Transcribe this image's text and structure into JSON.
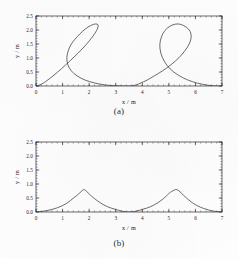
{
  "figure": {
    "background_color": "#fdfdfd",
    "ink_color": "#2b2b2b",
    "curve_color": "#3a3a3a"
  },
  "panels": [
    {
      "id": "a",
      "caption": "(a)",
      "xlabel": "x / m",
      "ylabel": "y / m",
      "xticklabels": [
        "0",
        "1",
        "2",
        "3",
        "4",
        "5",
        "6",
        "7"
      ],
      "yticklabels": [
        "0.0",
        "0.5",
        "1.0",
        "1.5",
        "2.0",
        "2.5"
      ]
    },
    {
      "id": "b",
      "caption": "(b)",
      "xlabel": "x / m",
      "ylabel": "y / m",
      "xticklabels": [
        "0",
        "1",
        "2",
        "3",
        "4",
        "5",
        "6",
        "7"
      ],
      "yticklabels": [
        "0.0",
        "0.5",
        "1.0",
        "1.5",
        "2.0",
        "2.5"
      ]
    }
  ],
  "chart_data": [
    {
      "type": "line",
      "panel": "a",
      "title": "(a)",
      "xlabel": "x / m",
      "ylabel": "y / m",
      "xlim": [
        0,
        7
      ],
      "ylim": [
        0.0,
        2.5
      ],
      "xticks": [
        0,
        1,
        2,
        3,
        4,
        5,
        6,
        7
      ],
      "yticks": [
        0.0,
        0.5,
        1.0,
        1.5,
        2.0,
        2.5
      ],
      "grid": false,
      "legend": null,
      "description": "Prolate cycloid (trochoid with loops): two looped arches over x = 0 to 7",
      "curve_family": "prolate cycloid",
      "parametric": {
        "x": "a*t - b*sin(t)",
        "y": "a - b*cos(t)",
        "a": 0.5577,
        "b": 1.111,
        "t_range": [
          0,
          12.566
        ]
      },
      "features": {
        "loop_centers_x": [
          1.75,
          5.25
        ],
        "loop_top_y": 2.2,
        "self_crossing_y": 0.65,
        "self_crossing_x": [
          1.75,
          5.25
        ],
        "baseline_minima_x": [
          0.0,
          3.5,
          7.0
        ],
        "baseline_y": 0.0
      },
      "series": [
        {
          "name": "prolate cycloid",
          "x": [
            0.0,
            0.12,
            0.27,
            0.45,
            0.68,
            0.95,
            1.26,
            1.58,
            1.88,
            2.12,
            2.28,
            2.34,
            2.3,
            2.16,
            1.95,
            1.75,
            1.55,
            1.35,
            1.22,
            1.16,
            1.2,
            1.33,
            1.55,
            1.85,
            2.2,
            2.58,
            2.95,
            3.28,
            3.5,
            3.62,
            3.77,
            3.95,
            4.18,
            4.45,
            4.76,
            5.08,
            5.38,
            5.62,
            5.78,
            5.84,
            5.8,
            5.66,
            5.45,
            5.25,
            5.05,
            4.85,
            4.72,
            4.66,
            4.7,
            4.83,
            5.05,
            5.35,
            5.7,
            6.08,
            6.45,
            6.78,
            7.0
          ],
          "y": [
            0.0,
            0.03,
            0.1,
            0.22,
            0.39,
            0.61,
            0.88,
            1.17,
            1.47,
            1.75,
            1.98,
            2.14,
            2.21,
            2.2,
            2.1,
            1.95,
            1.76,
            1.53,
            1.28,
            1.01,
            0.76,
            0.54,
            0.36,
            0.21,
            0.11,
            0.04,
            0.01,
            0.0,
            0.0,
            0.01,
            0.04,
            0.11,
            0.21,
            0.36,
            0.54,
            0.76,
            1.01,
            1.28,
            1.53,
            1.76,
            1.95,
            2.1,
            2.2,
            2.21,
            2.14,
            1.98,
            1.75,
            1.47,
            1.17,
            0.88,
            0.61,
            0.39,
            0.22,
            0.1,
            0.03,
            0.0,
            0.0
          ]
        }
      ]
    },
    {
      "type": "line",
      "panel": "b",
      "title": "(b)",
      "xlabel": "x / m",
      "ylabel": "y / m",
      "xlim": [
        0,
        7
      ],
      "ylim": [
        0.0,
        2.5
      ],
      "xticks": [
        0,
        1,
        2,
        3,
        4,
        5,
        6,
        7
      ],
      "yticks": [
        0.0,
        0.5,
        1.0,
        1.5,
        2.0,
        2.5
      ],
      "grid": false,
      "legend": null,
      "description": "Cusped (ordinary) cycloid-like curve: two cusped humps peaking near y = 0.8",
      "curve_family": "cycloid / cusped arch",
      "features": {
        "peak_x": [
          1.8,
          5.3
        ],
        "peak_y": 0.8,
        "baseline_minima_x": [
          0.0,
          3.5,
          7.0
        ],
        "baseline_y": 0.0
      },
      "series": [
        {
          "name": "cusped cycloid",
          "x": [
            0.0,
            0.2,
            0.4,
            0.6,
            0.8,
            1.0,
            1.2,
            1.4,
            1.55,
            1.7,
            1.8,
            1.9,
            2.05,
            2.2,
            2.4,
            2.6,
            2.8,
            3.0,
            3.2,
            3.35,
            3.5,
            3.65,
            3.8,
            4.0,
            4.2,
            4.4,
            4.6,
            4.8,
            5.0,
            5.1,
            5.22,
            5.3,
            5.42,
            5.55,
            5.7,
            5.9,
            6.1,
            6.3,
            6.5,
            6.7,
            6.85,
            7.0
          ],
          "y": [
            0.0,
            0.02,
            0.05,
            0.09,
            0.15,
            0.23,
            0.34,
            0.49,
            0.6,
            0.73,
            0.8,
            0.74,
            0.6,
            0.48,
            0.34,
            0.23,
            0.15,
            0.09,
            0.04,
            0.01,
            0.0,
            0.01,
            0.04,
            0.09,
            0.15,
            0.23,
            0.34,
            0.48,
            0.66,
            0.73,
            0.79,
            0.8,
            0.72,
            0.6,
            0.47,
            0.32,
            0.21,
            0.13,
            0.07,
            0.03,
            0.01,
            0.0
          ]
        }
      ]
    }
  ]
}
